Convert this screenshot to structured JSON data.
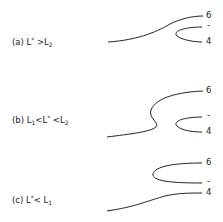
{
  "panels": [
    {
      "id": "a",
      "prefix": "(a) L",
      "star": "*",
      "rel1": " >L",
      "sub1": "2",
      "labels": {
        "top": "6",
        "mid": "-",
        "bottom": "4"
      }
    },
    {
      "id": "b",
      "prefix": "(b) L",
      "sub0": "1",
      "rel0": "<L",
      "star": "*",
      "rel1": " <L",
      "sub1": "2",
      "labels": {
        "top": "6",
        "mid": "-",
        "bottom": "4"
      }
    },
    {
      "id": "c",
      "prefix": "(c) L",
      "star": "*",
      "rel1": "< L",
      "sub1": "1",
      "labels": {
        "top": "6",
        "mid": "-",
        "bottom": "4"
      }
    }
  ]
}
